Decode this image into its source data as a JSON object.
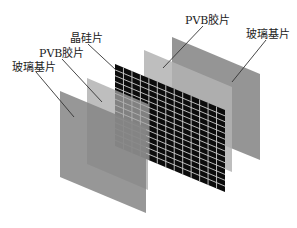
{
  "diagram": {
    "type": "exploded-layer-stack",
    "layers": [
      {
        "id": "back-glass",
        "label": "玻璃基片",
        "color": "#8a8a8a"
      },
      {
        "id": "back-pvb",
        "label": "PVB胶片",
        "color": "#a9a9a9"
      },
      {
        "id": "solar-cells",
        "label": "晶硅片",
        "color": "#111111"
      },
      {
        "id": "front-pvb",
        "label": "PVB胶片",
        "color": "#a9a9a9"
      },
      {
        "id": "front-glass",
        "label": "玻璃基片",
        "color": "#8a8a8a"
      }
    ],
    "labels": {
      "front_glass": "玻璃基片",
      "front_pvb": "PVB胶片",
      "cells": "晶硅片",
      "back_pvb": "PVB胶片",
      "back_glass": "玻璃基片"
    }
  }
}
